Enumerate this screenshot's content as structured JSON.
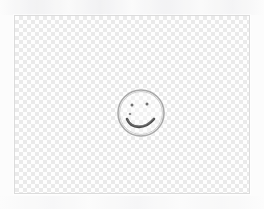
{
  "app": {
    "surface_name": "image-canvas",
    "background_color": "#fcfcfc"
  },
  "canvas": {
    "label": "Drawing canvas",
    "x": 14,
    "y": 15,
    "width": 236,
    "height": 179,
    "border_color": "#dcdcdc",
    "transparency": {
      "label": "Transparent background",
      "pattern": "checkerboard",
      "cell_size_px": 4,
      "light_color": "#ffffff",
      "dark_color": "#e2e2e2"
    }
  },
  "drawing": {
    "name": "smiley-face",
    "description": "Hand-drawn pencil smiley face",
    "stroke_color": "#8d8d8d",
    "accent_stroke_color": "#555555",
    "face": {
      "label": "Face outline",
      "center_x": 126,
      "center_y": 97,
      "radius_x": 23,
      "radius_y": 23,
      "stroke_width": 1.6,
      "color": "#a9a9a9"
    },
    "left_eye": {
      "label": "Left eye",
      "center_x": 117,
      "center_y": 89,
      "radius": 1.5,
      "color": "#6f6f6f"
    },
    "right_eye": {
      "label": "Right eye",
      "center_x": 132,
      "center_y": 88,
      "radius": 1.5,
      "color": "#6f6f6f"
    },
    "nose": {
      "label": "Nose dot",
      "center_x": 115,
      "center_y": 98,
      "radius": 1.3,
      "color": "#8a8a8a"
    },
    "mouth": {
      "label": "Smiling mouth",
      "path": "M 112 103 C 116 113, 130 114, 139 103",
      "stroke_width": 2.6,
      "color": "#4f4f4f"
    }
  }
}
